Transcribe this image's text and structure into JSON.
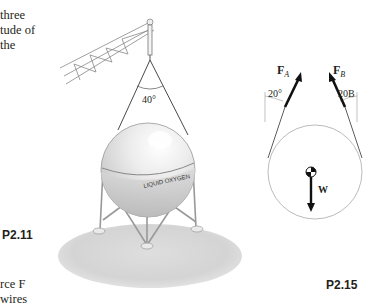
{
  "left_text": {
    "top_lines": [
      "three",
      "tude of",
      "the"
    ],
    "bottom_lines": [
      "rce F",
      "wires"
    ]
  },
  "figure_p2_11": {
    "label": "P2.11",
    "angle_label": "40°",
    "tank_text": "LIQUID OXYGEN"
  },
  "figure_p2_15": {
    "label": "P2.15",
    "force_a": "F",
    "force_a_sub": "A",
    "force_b": "F",
    "force_b_sub": "B",
    "angle_a": "20°",
    "angle_b": "20B",
    "weight": "W"
  }
}
